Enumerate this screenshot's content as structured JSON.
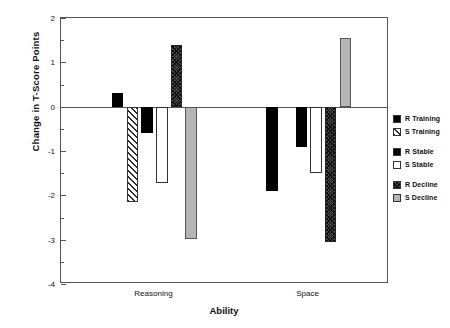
{
  "chart_data": {
    "type": "bar",
    "title": "",
    "xlabel": "Ability",
    "ylabel": "Change in T-Score Points",
    "categories": [
      "Reasoning",
      "Space"
    ],
    "ylim": [
      -4,
      2
    ],
    "yticks": [
      2,
      1,
      0,
      -1,
      -2,
      -3,
      -4
    ],
    "ytick_labels": [
      "2",
      "1",
      "0",
      "-1",
      "-2",
      "-3",
      "-4"
    ],
    "grid": false,
    "legend_position": "right",
    "series": [
      {
        "name": "R Training",
        "fill": "solid",
        "values": [
          0.3,
          -1.9
        ]
      },
      {
        "name": "S Training",
        "fill": "diag",
        "values": [
          -2.15,
          0.0
        ]
      },
      {
        "name": "R  Stable",
        "fill": "solid",
        "values": [
          -0.6,
          -0.9
        ]
      },
      {
        "name": "S  Stable",
        "fill": "white",
        "values": [
          -1.72,
          -1.5
        ]
      },
      {
        "name": "R  Decline",
        "fill": "cross",
        "values": [
          1.4,
          -3.05
        ]
      },
      {
        "name": "S  Decline",
        "fill": "gray",
        "values": [
          -2.98,
          1.55
        ]
      }
    ]
  },
  "axis": {
    "y_title": "Change in T-Score Points",
    "x_title": "Ability",
    "x_labels": [
      "Reasoning",
      "Space"
    ],
    "y_tick_labels": [
      "2",
      "1",
      "0",
      "-1",
      "-2",
      "-3",
      "-4"
    ]
  },
  "legend": {
    "groups": [
      {
        "items": [
          {
            "label": "R Training",
            "fill": "solid"
          },
          {
            "label": "S Training",
            "fill": "diag"
          }
        ]
      },
      {
        "items": [
          {
            "label": "R  Stable",
            "fill": "solid"
          },
          {
            "label": "S  Stable",
            "fill": "white"
          }
        ]
      },
      {
        "items": [
          {
            "label": "R  Decline",
            "fill": "cross"
          },
          {
            "label": "S  Decline",
            "fill": "gray"
          }
        ]
      }
    ]
  },
  "colors": {
    "frame": "#555555",
    "solid": "#000000",
    "gray": "#b5b5b5",
    "background": "#ffffff"
  }
}
